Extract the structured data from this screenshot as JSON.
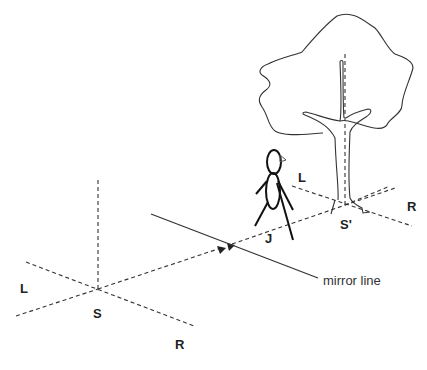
{
  "diagram": {
    "type": "mirror-reflection-illustration",
    "labels": {
      "source_left": "L",
      "source_point": "S",
      "source_right": "R",
      "person": "J",
      "image_left": "L",
      "image_point": "S'",
      "image_right": "R",
      "mirror": "mirror line"
    },
    "elements": [
      {
        "id": "source-axes",
        "description": "dashed 3D axes at point S"
      },
      {
        "id": "image-axes",
        "description": "dashed 3D axes at point S' at base of tree"
      },
      {
        "id": "mirror-line",
        "description": "solid diagonal line representing the mirror"
      },
      {
        "id": "sight-line",
        "description": "dashed line from S through mirror to S' with arrowheads"
      },
      {
        "id": "stick-figure",
        "description": "person J standing near mirror"
      },
      {
        "id": "tree",
        "description": "outlined tree with trunk at S'"
      }
    ],
    "colors": {
      "stroke": "#333333",
      "figure": "#111111",
      "background": "#ffffff"
    }
  }
}
